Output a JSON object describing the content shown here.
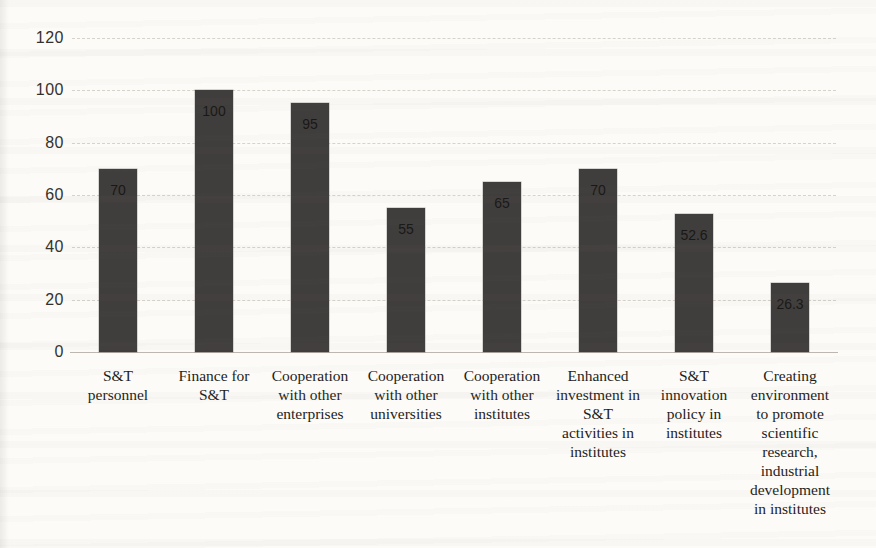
{
  "chart_data": {
    "type": "bar",
    "title": "",
    "xlabel": "",
    "ylabel": "",
    "categories": [
      "S&T personnel",
      "Finance for S&T",
      "Cooperation with other enterprises",
      "Cooperation with other universities",
      "Cooperation with other institutes",
      "Enhanced investment in S&T activities in institutes",
      "S&T innovation policy in institutes",
      "Creating environment to promote scientific research, industrial development in institutes"
    ],
    "categories_wrapped": [
      "S&T\npersonnel",
      "Finance for\nS&T",
      "Cooperation\nwith other\nenterprises",
      "Cooperation\nwith other\nuniversities",
      "Cooperation\nwith other\ninstitutes",
      "Enhanced\ninvestment in\nS&T\nactivities in\ninstitutes",
      "S&T\ninnovation\npolicy in\ninstitutes",
      "Creating\nenvironment\nto promote\nscientific\nresearch,\nindustrial\ndevelopment\nin institutes"
    ],
    "values": [
      70,
      100,
      95,
      55,
      65,
      70,
      52.6,
      26.3
    ],
    "data_labels": [
      "70",
      "100",
      "95",
      "55",
      "65",
      "70",
      "52.6",
      "26.3"
    ],
    "data_label_position": "inside-end",
    "ylim": [
      0,
      120
    ],
    "yticks": [
      0,
      20,
      40,
      60,
      80,
      100,
      120
    ],
    "grid": true,
    "legend": false,
    "colors": {
      "bar": "#403e3d",
      "gridline": "#d7d3cb",
      "axis_line": "#bdb8af",
      "background": "#fcfbf8",
      "tick_text": "#33312e",
      "category_text": "#1f1d1a",
      "data_label_text": "#1a1816"
    }
  }
}
